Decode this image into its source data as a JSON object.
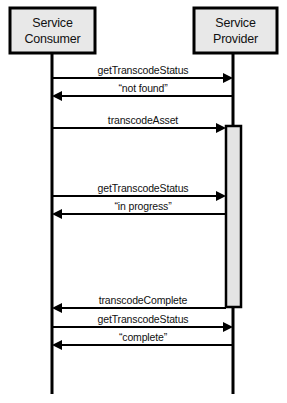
{
  "diagram": {
    "type": "uml-sequence-diagram",
    "canvas": {
      "width": 287,
      "height": 403
    },
    "style": {
      "box_fill": "#e8e8e8",
      "activation_fill": "#e4e4e4",
      "stroke": "#000000",
      "background": "#ffffff"
    },
    "participants": [
      {
        "id": "consumer",
        "name": "service-consumer",
        "line1": "Service",
        "line2": "Consumer",
        "box": {
          "x": 10,
          "y": 8,
          "width": 85,
          "height": 45
        },
        "lifeline_x": 52,
        "lifeline_top": 53,
        "lifeline_bottom": 394
      },
      {
        "id": "provider",
        "name": "service-provider",
        "line1": "Service",
        "line2": "Provider",
        "box": {
          "x": 194,
          "y": 8,
          "width": 83,
          "height": 45
        },
        "lifeline_x": 233,
        "lifeline_top": 53,
        "lifeline_bottom": 394
      }
    ],
    "activations": [
      {
        "id": "provider-transcode-activation",
        "participant": "provider",
        "x": 226,
        "y": 126,
        "width": 15,
        "height": 181
      }
    ],
    "messages": [
      {
        "id": "msg-1",
        "label": "getTranscodeStatus",
        "from": "consumer",
        "to": "provider",
        "direction": "right",
        "y": 78,
        "x1": 52,
        "x2": 233,
        "label_x": 143,
        "label_y": 74
      },
      {
        "id": "msg-2",
        "label": "“not found”",
        "from": "provider",
        "to": "consumer",
        "direction": "left",
        "y": 96,
        "x1": 233,
        "x2": 52,
        "label_x": 143,
        "label_y": 92
      },
      {
        "id": "msg-3",
        "label": "transcodeAsset",
        "from": "consumer",
        "to": "provider",
        "direction": "right",
        "y": 128,
        "x1": 52,
        "x2": 226,
        "label_x": 143,
        "label_y": 124
      },
      {
        "id": "msg-4",
        "label": "getTranscodeStatus",
        "from": "consumer",
        "to": "provider",
        "direction": "right",
        "y": 196,
        "x1": 52,
        "x2": 226,
        "label_x": 143,
        "label_y": 192
      },
      {
        "id": "msg-5",
        "label": "“in progress”",
        "from": "provider",
        "to": "consumer",
        "direction": "left",
        "y": 214,
        "x1": 226,
        "x2": 52,
        "label_x": 143,
        "label_y": 210
      },
      {
        "id": "msg-6",
        "label": "transcodeComplete",
        "from": "provider",
        "to": "consumer",
        "direction": "left",
        "y": 308,
        "x1": 226,
        "x2": 52,
        "label_x": 143,
        "label_y": 304
      },
      {
        "id": "msg-7",
        "label": "getTranscodeStatus",
        "from": "consumer",
        "to": "provider",
        "direction": "right",
        "y": 327,
        "x1": 52,
        "x2": 233,
        "label_x": 143,
        "label_y": 323
      },
      {
        "id": "msg-8",
        "label": "“complete”",
        "from": "provider",
        "to": "consumer",
        "direction": "left",
        "y": 345,
        "x1": 233,
        "x2": 52,
        "label_x": 143,
        "label_y": 341
      }
    ]
  }
}
